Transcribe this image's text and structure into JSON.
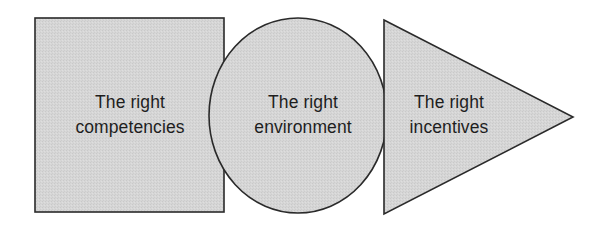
{
  "diagram": {
    "type": "flow-of-shapes",
    "fill_color": "#d3d3d3",
    "stroke_color": "#2a2a2a",
    "text_color": "#1e1e1e",
    "shapes": [
      {
        "kind": "square",
        "line1": "The right",
        "line2": "competencies"
      },
      {
        "kind": "circle",
        "line1": "The right",
        "line2": "environment"
      },
      {
        "kind": "triangle-arrow",
        "line1": "The right",
        "line2": "incentives"
      }
    ]
  }
}
